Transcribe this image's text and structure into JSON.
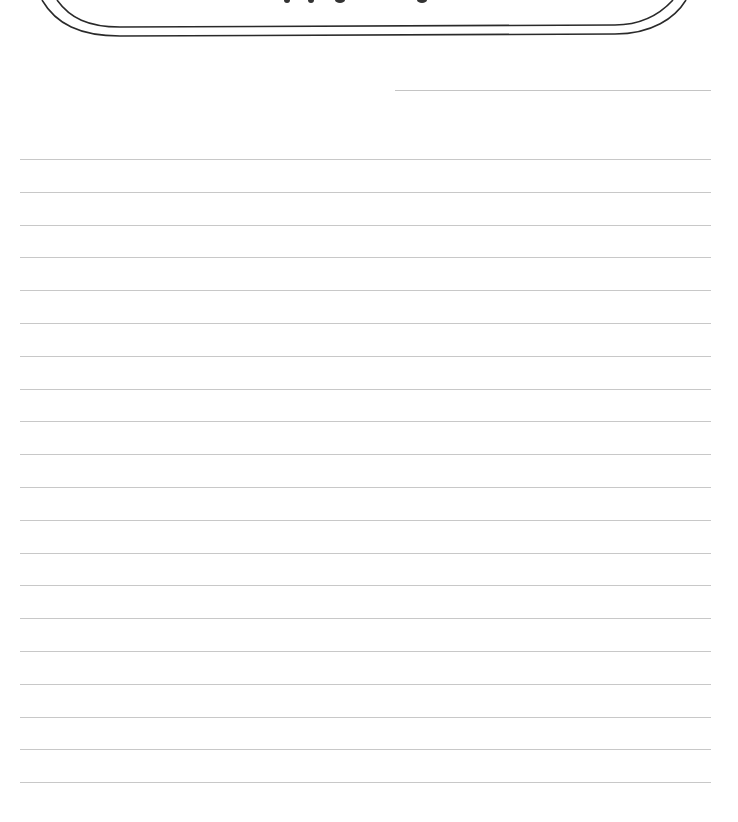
{
  "page": {
    "type": "lined writing paper",
    "background": "#ffffff",
    "rule_color": "#c8c8c8",
    "frame_color": "#2a2a2a"
  },
  "title_banner": {
    "visible_text_fragment": "pp g g",
    "note": "title cut off at top edge; only descenders visible"
  },
  "name_line": {
    "label": ""
  },
  "lines": {
    "count": 20,
    "first_y": 159,
    "spacing": 32.8,
    "left": 20,
    "right": 711
  }
}
